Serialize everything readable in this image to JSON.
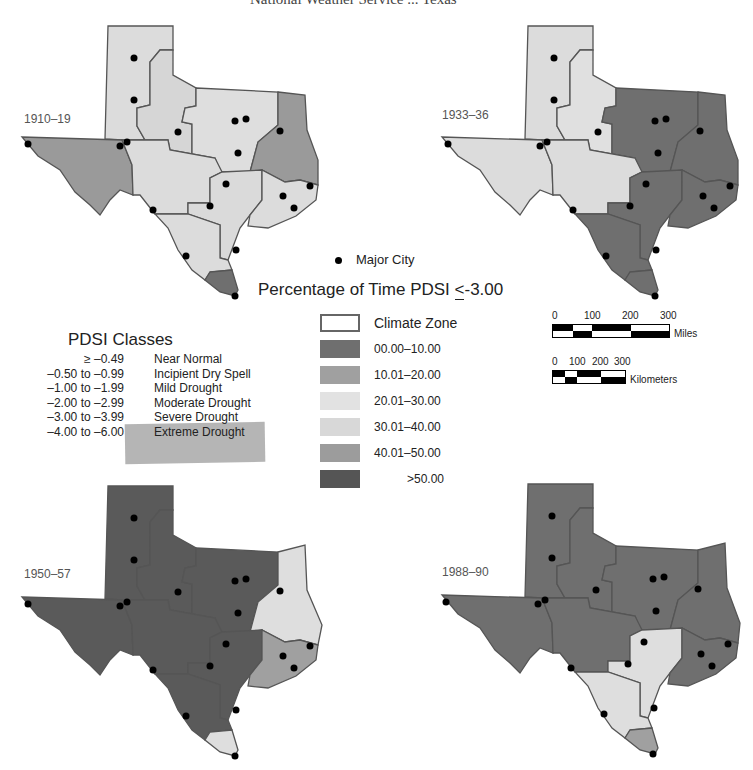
{
  "title": "National Weather Service ... Texas",
  "maps": [
    {
      "period": "1910–19",
      "zones": {
        "panhandle": "#dcdcdc",
        "lowrolling": "#d6d6d6",
        "northcentral": "#dedede",
        "east": "#9a9a9a",
        "transpecos": "#9a9a9a",
        "edwards": "#dcdcdc",
        "southcentral": "#dadada",
        "uppercoast": "#dcdcdc",
        "south": "#dcdcdc",
        "lowervalley": "#6f6f6f"
      }
    },
    {
      "period": "1933–36",
      "zones": {
        "panhandle": "#dcdcdc",
        "lowrolling": "#e0e0e0",
        "northcentral": "#6f6f6f",
        "east": "#6f6f6f",
        "transpecos": "#dcdcdc",
        "edwards": "#dcdcdc",
        "southcentral": "#6f6f6f",
        "uppercoast": "#6f6f6f",
        "south": "#6f6f6f",
        "lowervalley": "#6f6f6f"
      }
    },
    {
      "period": "1950–57",
      "zones": {
        "panhandle": "#5a5a5a",
        "lowrolling": "#5a5a5a",
        "northcentral": "#5a5a5a",
        "east": "#dedede",
        "transpecos": "#5a5a5a",
        "edwards": "#5a5a5a",
        "southcentral": "#5a5a5a",
        "uppercoast": "#a0a0a0",
        "south": "#5a5a5a",
        "lowervalley": "#dedede"
      }
    },
    {
      "period": "1988–90",
      "zones": {
        "panhandle": "#6f6f6f",
        "lowrolling": "#6f6f6f",
        "northcentral": "#6f6f6f",
        "east": "#6f6f6f",
        "transpecos": "#6f6f6f",
        "edwards": "#6f6f6f",
        "southcentral": "#dedede",
        "uppercoast": "#6f6f6f",
        "south": "#dedede",
        "lowervalley": "#a0a0a0"
      }
    }
  ],
  "city_legend": "Major City",
  "percentage_title_prefix": "Percentage of Time PDSI ",
  "percentage_title_op": "<",
  "percentage_title_value": "-3.00",
  "percentage_legend": [
    {
      "label": "Climate Zone",
      "type": "zone"
    },
    {
      "label": "00.00–10.00",
      "color": "#6f6f6f"
    },
    {
      "label": "10.01–20.00",
      "color": "#a0a0a0"
    },
    {
      "label": "20.01–30.00",
      "color": "#e2e2e2"
    },
    {
      "label": "30.01–40.00",
      "color": "#d8d8d8"
    },
    {
      "label": "40.01–50.00",
      "color": "#9c9c9c"
    },
    {
      "label": ">50.00",
      "color": "#555555"
    }
  ],
  "pdsi_classes": {
    "title": "PDSI Classes",
    "rows": [
      {
        "range": "≥ –0.49",
        "label": "Near Normal"
      },
      {
        "range": "–0.50 to –0.99",
        "label": "Incipient Dry Spell"
      },
      {
        "range": "–1.00 to –1.99",
        "label": "Mild Drought"
      },
      {
        "range": "–2.00 to –2.99",
        "label": "Moderate Drought"
      },
      {
        "range": "–3.00 to –3.99",
        "label": "Severe Drought"
      },
      {
        "range": "–4.00 to –6.00",
        "label": "Extreme Drought"
      }
    ]
  },
  "scale_bars": {
    "miles": {
      "ticks": [
        "0",
        "100",
        "200",
        "300"
      ],
      "unit": "Miles"
    },
    "kilometers": {
      "ticks": [
        "0",
        "100",
        "200",
        "300"
      ],
      "unit": "Kilometers"
    }
  }
}
